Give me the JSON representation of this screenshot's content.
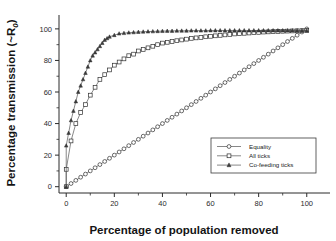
{
  "chart_data": {
    "type": "line",
    "title": "",
    "xlabel": "Percentage of population removed",
    "ylabel": "Percentage transmission (~R0)",
    "ylabel_main": "Percentage transmission (~R",
    "ylabel_sub": "0",
    "ylabel_tail": ")",
    "xlim": [
      -3,
      108
    ],
    "ylim": [
      -4,
      105
    ],
    "xticks": [
      0,
      20,
      40,
      60,
      80,
      100
    ],
    "xtick_labels": [
      "0",
      "20",
      "40",
      "60",
      "80",
      "100"
    ],
    "yticks": [
      0,
      20,
      40,
      60,
      80,
      100
    ],
    "ytick_labels": [
      "0",
      "20",
      "40",
      "60",
      "80",
      "100"
    ],
    "x_minor_ticks": [
      10,
      30,
      50,
      70,
      90
    ],
    "y_minor_ticks": [
      10,
      30,
      50,
      70,
      90
    ],
    "grid": false,
    "legend_position": "lower-right",
    "series": [
      {
        "name": "Equality",
        "marker": "circle-open",
        "x": [
          0,
          2,
          4,
          6,
          8,
          10,
          12,
          14,
          16,
          18,
          20,
          22,
          24,
          26,
          28,
          30,
          32,
          34,
          36,
          38,
          40,
          42,
          44,
          46,
          48,
          50,
          52,
          54,
          56,
          58,
          60,
          62,
          64,
          66,
          68,
          70,
          72,
          74,
          76,
          78,
          80,
          82,
          84,
          86,
          88,
          90,
          92,
          94,
          96,
          98,
          100
        ],
        "values": [
          0,
          2,
          4,
          6,
          8,
          10,
          12,
          14,
          16,
          18,
          20,
          22,
          24,
          26,
          28,
          30,
          32,
          34,
          36,
          38,
          40,
          42,
          44,
          46,
          48,
          50,
          52,
          54,
          56,
          58,
          60,
          62,
          64,
          66,
          68,
          70,
          72,
          74,
          76,
          78,
          80,
          82,
          84,
          86,
          88,
          90,
          92,
          94,
          96,
          98,
          100
        ]
      },
      {
        "name": "All ticks",
        "marker": "square-open",
        "x": [
          0,
          0,
          2,
          4,
          6,
          8,
          10,
          12,
          14,
          16,
          18,
          20,
          22,
          24,
          26,
          28,
          30,
          32,
          34,
          36,
          38,
          40,
          42,
          44,
          46,
          48,
          50,
          52,
          54,
          56,
          58,
          60,
          62,
          64,
          66,
          68,
          70,
          72,
          74,
          76,
          78,
          80,
          82,
          84,
          86,
          88,
          90,
          92,
          94,
          96,
          98,
          100
        ],
        "values": [
          0,
          11,
          29,
          40,
          47,
          52,
          58,
          63,
          68,
          71,
          74,
          77,
          79,
          81,
          83,
          84,
          86,
          87,
          88,
          89,
          90,
          91,
          91.5,
          92,
          92.5,
          93,
          93.5,
          94,
          94.3,
          94.6,
          95,
          95.3,
          95.6,
          95.9,
          96.2,
          96.5,
          96.8,
          97,
          97.2,
          97.4,
          97.6,
          97.8,
          98,
          98.1,
          98.3,
          98.4,
          98.5,
          98.6,
          98.7,
          98.8,
          98.9,
          99
        ]
      },
      {
        "name": "Co-feeding ticks",
        "marker": "triangle-filled",
        "x": [
          0,
          0,
          1,
          2,
          3,
          4,
          5,
          6,
          7,
          8,
          9,
          10,
          11,
          12,
          13,
          14,
          15,
          16,
          17,
          18,
          20,
          22,
          24,
          26,
          28,
          30,
          32,
          34,
          36,
          38,
          40,
          42,
          44,
          46,
          48,
          50,
          52,
          54,
          56,
          58,
          60,
          62,
          64,
          66,
          68,
          70,
          72,
          74,
          76,
          78,
          80,
          82,
          84,
          86,
          88,
          90,
          92,
          94,
          96,
          98,
          100
        ],
        "values": [
          0,
          26,
          34,
          42,
          48,
          54,
          60,
          64,
          68,
          72,
          76,
          80,
          83,
          85,
          87,
          89,
          91,
          93,
          94,
          95,
          96,
          97,
          97.3,
          97.6,
          97.8,
          98,
          98.2,
          98.3,
          98.4,
          98.5,
          98.6,
          98.7,
          98.7,
          98.8,
          98.8,
          98.8,
          98.9,
          98.9,
          98.9,
          98.9,
          99,
          99,
          99,
          99,
          99,
          99,
          99,
          99,
          99,
          99,
          99,
          99,
          99,
          99,
          99,
          99,
          99,
          99,
          99,
          99,
          99
        ]
      }
    ]
  },
  "legend": {
    "items": [
      {
        "label": "Equality",
        "marker": "circle-open"
      },
      {
        "label": "All ticks",
        "marker": "square-open"
      },
      {
        "label": "Co-feeding ticks",
        "marker": "triangle-filled"
      }
    ]
  },
  "colors": {
    "line": "#555555",
    "marker_stroke": "#2f2f2f",
    "marker_fill_open": "#ffffff",
    "marker_fill_solid": "#3c3c3c",
    "axis": "#2b2b2b",
    "text": "#141414",
    "background": "#ffffff"
  }
}
